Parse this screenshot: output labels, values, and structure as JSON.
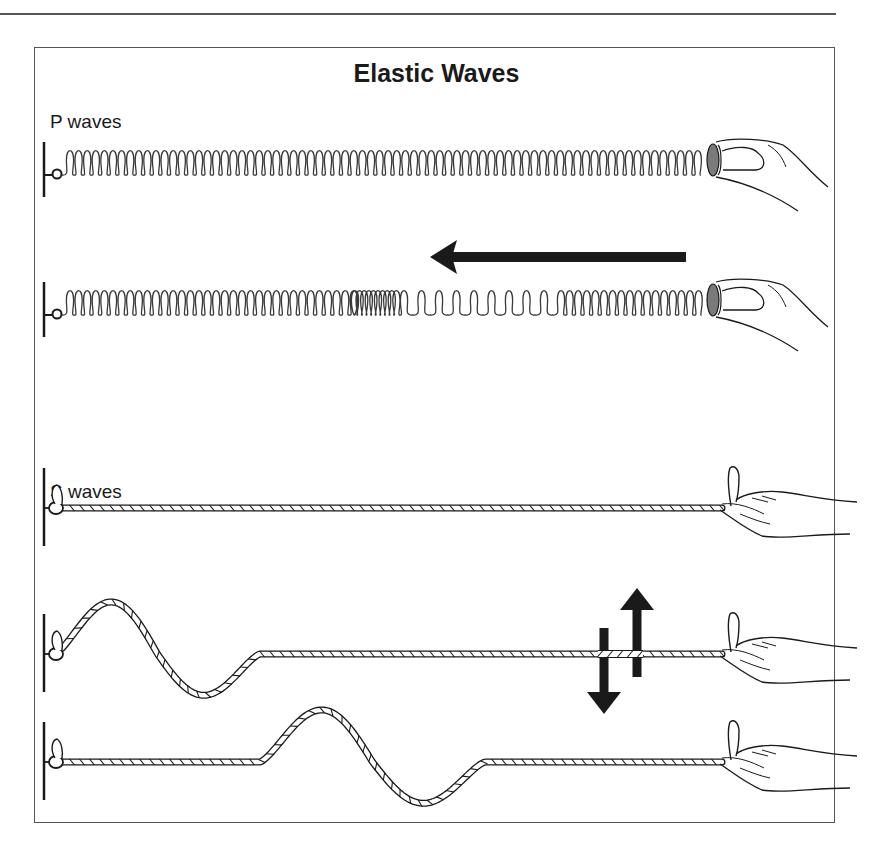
{
  "title": "Elastic Waves",
  "sections": {
    "p_waves": {
      "label": "P waves"
    },
    "s_waves": {
      "label": "S waves"
    }
  },
  "colors": {
    "ink": "#1a1a1a",
    "frame": "#555555",
    "coil": "#3a3a3a",
    "disk": "#7a7a7a",
    "rope_fill": "#ffffff"
  },
  "diagram": {
    "p_rows": [
      {
        "name": "spring-at-rest",
        "y": 175,
        "x_start": 70,
        "x_end": 712,
        "compression": null,
        "arrow": null
      },
      {
        "name": "spring-compressional-pulse",
        "y": 315,
        "x_start": 70,
        "x_end": 712,
        "compression": {
          "dense_from": 355,
          "dense_to": 400,
          "sparse_to": 555
        },
        "arrow": {
          "direction": "left",
          "x_tail": 686,
          "x_tip": 430,
          "y": 257
        }
      }
    ],
    "s_rows": [
      {
        "name": "rope-at-rest",
        "y": 508,
        "pulse": null
      },
      {
        "name": "rope-transverse-pulse-near",
        "y": 654,
        "pulse": {
          "x0": 55,
          "x1": 260,
          "amp_up": 58,
          "amp_down": 46
        }
      },
      {
        "name": "rope-transverse-pulse-far",
        "y": 762,
        "pulse": {
          "x0": 260,
          "x1": 485,
          "amp_up": 58,
          "amp_down": 46
        }
      }
    ],
    "motion_arrows": {
      "up_x": 637,
      "down_x": 604,
      "up_tip_y": 588,
      "up_tail_y": 677,
      "down_tail_y": 628,
      "down_tip_y": 714
    }
  }
}
